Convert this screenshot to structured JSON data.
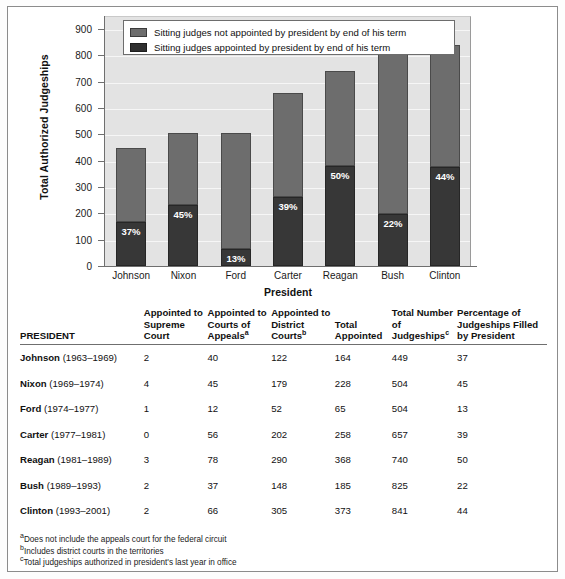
{
  "chart_data": {
    "type": "bar",
    "stacked": true,
    "title": "",
    "xlabel": "President",
    "ylabel": "Total Authorized Judgeships",
    "ylim": [
      0,
      950
    ],
    "yticks": [
      0,
      100,
      200,
      300,
      400,
      500,
      600,
      700,
      800,
      900
    ],
    "grid": true,
    "legend_position": "top-center",
    "categories": [
      "Johnson",
      "Nixon",
      "Ford",
      "Carter",
      "Reagan",
      "Bush",
      "Clinton"
    ],
    "series": [
      {
        "name": "Sitting judges appointed by president by end of his term",
        "color": "#373737",
        "values": [
          166,
          233,
          66,
          262,
          380,
          196,
          375
        ],
        "labels": [
          "37%",
          "45%",
          "13%",
          "39%",
          "50%",
          "22%",
          "44%"
        ]
      },
      {
        "name": "Sitting judges not appointed by president by end of his term",
        "color": "#6d6d6d",
        "values": [
          283,
          271,
          438,
          395,
          360,
          629,
          466
        ]
      }
    ],
    "totals": [
      449,
      504,
      504,
      657,
      740,
      825,
      841
    ]
  },
  "chart": {
    "y_axis_title": "Total Authorized Judgeships",
    "x_axis_title": "President",
    "y_tick_labels": [
      "900",
      "800",
      "700",
      "600",
      "500",
      "400",
      "300",
      "200",
      "100",
      "0"
    ],
    "x_tick_labels": [
      "Johnson",
      "Nixon",
      "Ford",
      "Carter",
      "Reagan",
      "Bush",
      "Clinton"
    ],
    "legend": [
      {
        "swatch": "light",
        "label": "Sitting judges not appointed by president by end of his term"
      },
      {
        "swatch": "dark",
        "label": "Sitting judges appointed by president by end of his term"
      }
    ],
    "bar_labels": [
      "37%",
      "45%",
      "13%",
      "39%",
      "50%",
      "22%",
      "44%"
    ]
  },
  "table": {
    "headers": {
      "president": "PRESIDENT",
      "supreme": "Appointed to Supreme Court",
      "appeals": "Appointed to Courts of Appeals",
      "appeals_sup": "a",
      "district": "Appointed to District Courts",
      "district_sup": "b",
      "total_appointed": "Total Appointed",
      "total_judgeships": "Total Number of Judgeships",
      "total_judgeships_sup": "c",
      "percentage": "Percentage of Judgeships Filled by President"
    },
    "rows": [
      {
        "name": "Johnson",
        "years": "(1963–1969)",
        "supreme": "2",
        "appeals": "40",
        "district": "122",
        "total_appointed": "164",
        "total_judgeships": "449",
        "percentage": "37"
      },
      {
        "name": "Nixon",
        "years": "(1969–1974)",
        "supreme": "4",
        "appeals": "45",
        "district": "179",
        "total_appointed": "228",
        "total_judgeships": "504",
        "percentage": "45"
      },
      {
        "name": "Ford",
        "years": "(1974–1977)",
        "supreme": "1",
        "appeals": "12",
        "district": "52",
        "total_appointed": "65",
        "total_judgeships": "504",
        "percentage": "13"
      },
      {
        "name": "Carter",
        "years": "(1977–1981)",
        "supreme": "0",
        "appeals": "56",
        "district": "202",
        "total_appointed": "258",
        "total_judgeships": "657",
        "percentage": "39"
      },
      {
        "name": "Reagan",
        "years": "(1981–1989)",
        "supreme": "3",
        "appeals": "78",
        "district": "290",
        "total_appointed": "368",
        "total_judgeships": "740",
        "percentage": "50"
      },
      {
        "name": "Bush",
        "years": "(1989–1993)",
        "supreme": "2",
        "appeals": "37",
        "district": "148",
        "total_appointed": "185",
        "total_judgeships": "825",
        "percentage": "22"
      },
      {
        "name": "Clinton",
        "years": "(1993–2001)",
        "supreme": "2",
        "appeals": "66",
        "district": "305",
        "total_appointed": "373",
        "total_judgeships": "841",
        "percentage": "44"
      }
    ]
  },
  "footnotes": [
    {
      "marker": "a",
      "text": "Does not include the appeals court for the federal circuit"
    },
    {
      "marker": "b",
      "text": "Includes district courts in the territories"
    },
    {
      "marker": "c",
      "text": "Total judgeships authorized in president's last year in office"
    }
  ]
}
